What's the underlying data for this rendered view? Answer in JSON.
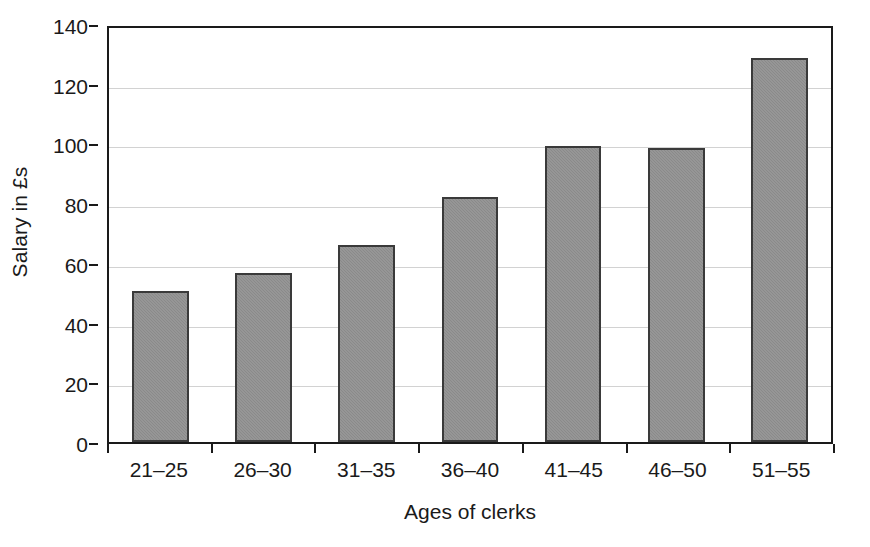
{
  "chart_data": {
    "type": "bar",
    "title": "",
    "xlabel": "Ages of clerks",
    "ylabel": "Salary in £s",
    "categories": [
      "21–25",
      "26–30",
      "31–35",
      "36–40",
      "41–45",
      "46–50",
      "51–55"
    ],
    "values": [
      51,
      57,
      66.5,
      83,
      100,
      99.5,
      130
    ],
    "ylim": [
      0,
      140
    ],
    "ytick_step": 20,
    "yticks": [
      0,
      20,
      40,
      60,
      80,
      100,
      120,
      140
    ],
    "ytick_labels": [
      "0",
      "20",
      "40",
      "60",
      "80",
      "100",
      "120",
      "140"
    ],
    "grid": "horizontal",
    "legend": "none",
    "bar_color": "#8a8a8a",
    "bar_edge_color": "#3a3a3a",
    "gridline_color": "#d2d2d2",
    "axis_color": "#1a1a1a",
    "background_color": "#ffffff"
  }
}
